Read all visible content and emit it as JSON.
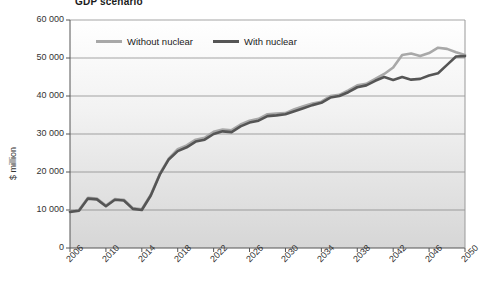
{
  "chart_data": {
    "type": "line",
    "title": "GDP scenario",
    "xlabel": "",
    "ylabel": "$ million",
    "xlim": [
      2006,
      2050
    ],
    "ylim": [
      0,
      60000
    ],
    "grid": true,
    "legend_position": "top-inside",
    "x_tick_labels": [
      "2006",
      "2010",
      "2014",
      "2018",
      "2022",
      "2026",
      "2030",
      "2034",
      "2038",
      "2042",
      "2046",
      "2050"
    ],
    "y_tick_labels": [
      "0",
      "10 000",
      "20 000",
      "30 000",
      "40 000",
      "50 000",
      "60 000"
    ],
    "y_tick_values": [
      0,
      10000,
      20000,
      30000,
      40000,
      50000,
      60000
    ],
    "colors": {
      "without_nuclear": "#a8a8a8",
      "with_nuclear": "#555555",
      "axis": "#555555",
      "gridline": "#808080",
      "plot_background_top": "#ffffff",
      "plot_background_bottom": "#d8d8d8"
    },
    "x": [
      2006,
      2007,
      2008,
      2009,
      2010,
      2011,
      2012,
      2013,
      2014,
      2015,
      2016,
      2017,
      2018,
      2019,
      2020,
      2021,
      2022,
      2023,
      2024,
      2025,
      2026,
      2027,
      2028,
      2029,
      2030,
      2031,
      2032,
      2033,
      2034,
      2035,
      2036,
      2037,
      2038,
      2039,
      2040,
      2041,
      2042,
      2043,
      2044,
      2045,
      2046,
      2047,
      2048,
      2049,
      2050
    ],
    "series": [
      {
        "name": "Without nuclear",
        "values": [
          9700,
          10000,
          13200,
          13000,
          11200,
          12900,
          12700,
          10500,
          10200,
          14000,
          19500,
          23500,
          26000,
          27000,
          28500,
          29000,
          30600,
          31200,
          31000,
          32500,
          33500,
          34000,
          35200,
          35400,
          35500,
          36500,
          37300,
          38000,
          38500,
          40000,
          40300,
          41500,
          42800,
          43200,
          44500,
          45800,
          47500,
          50800,
          51200,
          50500,
          51300,
          52700,
          52400,
          51500,
          50800
        ]
      },
      {
        "name": "With nuclear",
        "values": [
          9500,
          9800,
          13000,
          12800,
          11000,
          12700,
          12500,
          10300,
          10000,
          13800,
          19300,
          23300,
          25500,
          26500,
          28000,
          28500,
          30000,
          30700,
          30500,
          32000,
          33000,
          33500,
          34700,
          34900,
          35200,
          36000,
          36800,
          37600,
          38200,
          39600,
          40000,
          41000,
          42300,
          42800,
          44000,
          45000,
          44200,
          45000,
          44300,
          44500,
          45400,
          46000,
          48200,
          50400,
          50500
        ]
      }
    ]
  },
  "legend": {
    "items": [
      {
        "label": "Without nuclear",
        "color": "#a8a8a8"
      },
      {
        "label": "With nuclear",
        "color": "#555555"
      }
    ]
  }
}
